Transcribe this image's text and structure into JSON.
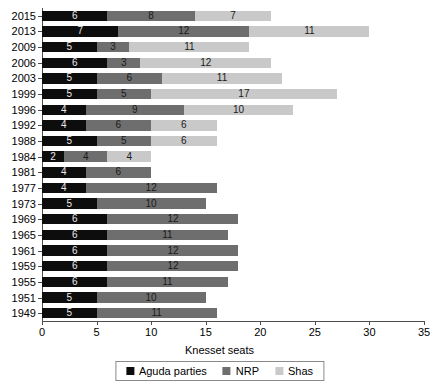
{
  "chart_data": {
    "type": "bar",
    "orientation": "horizontal",
    "stacked": true,
    "title": "",
    "xlabel": "Knesset seats",
    "ylabel": "",
    "xlim": [
      0,
      35
    ],
    "xticks": [
      0,
      5,
      10,
      15,
      20,
      25,
      30,
      35
    ],
    "grid": false,
    "legend_position": "bottom",
    "categories": [
      "2015",
      "2013",
      "2009",
      "2006",
      "2003",
      "1999",
      "1996",
      "1992",
      "1988",
      "1984",
      "1981",
      "1977",
      "1973",
      "1969",
      "1965",
      "1961",
      "1959",
      "1955",
      "1951",
      "1949"
    ],
    "series": [
      {
        "name": "Aguda parties",
        "color": "#0d0d0d",
        "values": [
          6,
          7,
          5,
          6,
          5,
          5,
          4,
          4,
          5,
          2,
          4,
          4,
          5,
          6,
          6,
          6,
          6,
          6,
          5,
          5
        ]
      },
      {
        "name": "NRP",
        "color": "#6e6e6e",
        "values": [
          8,
          12,
          3,
          3,
          6,
          5,
          9,
          6,
          5,
          4,
          6,
          12,
          10,
          12,
          11,
          12,
          12,
          11,
          10,
          11
        ]
      },
      {
        "name": "Shas",
        "color": "#c9c9c9",
        "values": [
          7,
          11,
          11,
          12,
          11,
          17,
          10,
          6,
          6,
          4,
          0,
          0,
          0,
          0,
          0,
          0,
          0,
          0,
          0,
          0
        ]
      }
    ],
    "totals": [
      21,
      30,
      19,
      21,
      22,
      27,
      23,
      16,
      16,
      10,
      10,
      16,
      15,
      18,
      17,
      18,
      18,
      17,
      15,
      16
    ]
  },
  "legend": {
    "items": [
      {
        "label": "Aguda parties",
        "color": "#0d0d0d"
      },
      {
        "label": "NRP",
        "color": "#6e6e6e"
      },
      {
        "label": "Shas",
        "color": "#c9c9c9"
      }
    ]
  }
}
